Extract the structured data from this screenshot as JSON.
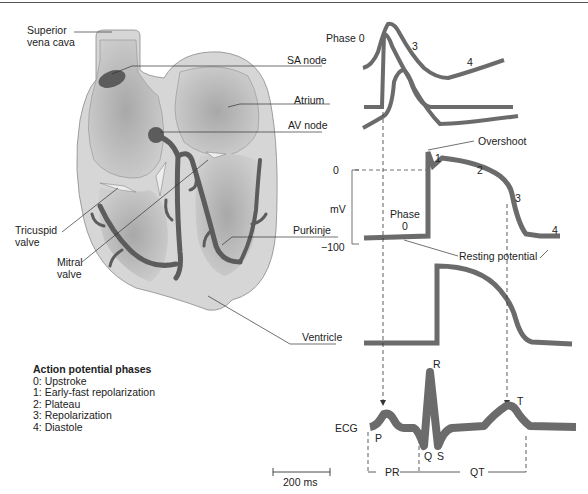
{
  "figure": {
    "caption_visible": false,
    "colors": {
      "trace": "#6b6b6b",
      "heart_outer": "#d6d6d6",
      "heart_chamber": "#bdbdbd",
      "conduction": "#5c5c5c",
      "leader_line": "#333333"
    }
  },
  "heart_labels": {
    "superior_vena_cava_1": "Superior",
    "superior_vena_cava_2": "vena cava",
    "tricuspid_1": "Tricuspid",
    "tricuspid_2": "valve",
    "mitral_1": "Mitral",
    "mitral_2": "valve"
  },
  "trace_labels": {
    "sa_node": "SA node",
    "atrium": "Atrium",
    "av_node": "AV node",
    "purkinje": "Purkinje",
    "ventricle": "Ventricle",
    "ecg": "ECG"
  },
  "sa_phase_labels": {
    "phase0": "Phase 0",
    "phase3": "3",
    "phase4": "4"
  },
  "purkinje_annotations": {
    "overshoot": "Overshoot",
    "resting_potential": "Resting potential",
    "phase_word": "Phase",
    "phase0": "0",
    "phase1": "1",
    "phase2": "2",
    "phase3": "3",
    "phase4": "4",
    "axis_label": "mV",
    "axis_max": "0",
    "axis_min": "−100"
  },
  "ecg_labels": {
    "p": "P",
    "q": "Q",
    "r": "R",
    "s": "S",
    "t": "T",
    "pr": "PR",
    "qt": "QT"
  },
  "scale_bar": {
    "label": "200 ms"
  },
  "legend": {
    "title": "Action potential phases",
    "items": [
      "0:  Upstroke",
      "1:  Early-fast repolarization",
      "2:  Plateau",
      "3:  Repolarization",
      "4:  Diastole"
    ]
  }
}
